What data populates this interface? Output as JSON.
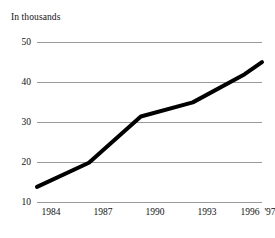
{
  "chart_data": {
    "type": "line",
    "title": "In thousands",
    "subtitle": "",
    "xlabel": "",
    "ylabel": "",
    "categories": [
      "1984",
      "1987",
      "1990",
      "1993",
      "1996",
      "'97"
    ],
    "x": [
      1984,
      1987,
      1990,
      1993,
      1996,
      1997
    ],
    "values": [
      14,
      20,
      31.5,
      35,
      42,
      45
    ],
    "series": [
      {
        "name": "In thousands",
        "values": [
          14,
          20,
          31.5,
          35,
          42,
          45
        ],
        "color": "#000000"
      }
    ],
    "ylim": [
      10,
      50
    ],
    "xlim": [
      1984,
      1997
    ],
    "yticks": [
      10,
      20,
      30,
      40,
      50
    ],
    "ytick_labels": [
      "10",
      "20",
      "30",
      "40",
      "50"
    ],
    "xtick_labels": [
      "1984",
      "1987",
      "1990",
      "1993",
      "1996",
      "'97"
    ],
    "grid": "horizontal",
    "legend": "none",
    "annotations": []
  },
  "axes": {
    "y_labels": [
      {
        "text": "50",
        "value": 50
      },
      {
        "text": "40",
        "value": 40
      },
      {
        "text": "30",
        "value": 30
      },
      {
        "text": "20",
        "value": 20
      },
      {
        "text": "10",
        "value": 10
      }
    ],
    "x_labels": [
      {
        "text": "1984",
        "value": 1984
      },
      {
        "text": "1987",
        "value": 1987
      },
      {
        "text": "1990",
        "value": 1990
      },
      {
        "text": "1993",
        "value": 1993
      },
      {
        "text": "1996",
        "value": 1996
      },
      {
        "text": "'97",
        "value": 1997
      }
    ]
  },
  "colors": {
    "line": "#000000",
    "gridline": "#9a9a9a",
    "text": "#111111",
    "background": "#ffffff"
  }
}
